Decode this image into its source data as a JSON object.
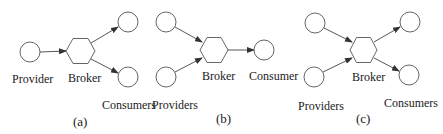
{
  "colors": {
    "stroke": "#555555",
    "arrow": "#333333",
    "fill": "#ffffff",
    "text": "#222222"
  },
  "panels": [
    {
      "caption": "(a)",
      "broker_label": "Broker",
      "left_label": "Provider",
      "right_label": "Consumers",
      "left_nodes": [
        "Provider"
      ],
      "right_nodes": [
        "Consumer 1",
        "Consumer 2"
      ]
    },
    {
      "caption": "(b)",
      "broker_label": "Broker",
      "left_label": "Providers",
      "right_label": "Consumer",
      "left_nodes": [
        "Provider 1",
        "Provider 2"
      ],
      "right_nodes": [
        "Consumer"
      ]
    },
    {
      "caption": "(c)",
      "broker_label": "Broker",
      "left_label": "Providers",
      "right_label": "Consumers",
      "left_nodes": [
        "Provider 1",
        "Provider 2"
      ],
      "right_nodes": [
        "Consumer 1",
        "Consumer 2"
      ]
    }
  ]
}
